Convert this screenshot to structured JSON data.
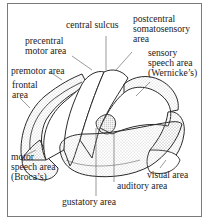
{
  "diagram": {
    "labels": {
      "central_sulcus": "central sulcus",
      "postcentral": [
        "postcentral",
        "somatosensory",
        "area"
      ],
      "precentral": [
        "precentral",
        "motor area"
      ],
      "sensory_speech": [
        "sensory",
        "speech area",
        "(Wernicke’s)"
      ],
      "premotor": "premotor area",
      "frontal": [
        "frontal",
        "area"
      ],
      "motor_speech": [
        "motor",
        "speech area",
        "(Broca’s)"
      ],
      "visual": "visual area",
      "auditory": "auditory area",
      "gustatory": "gustatory area"
    },
    "colors": {
      "frame": "#7a7a7a",
      "outline": "#2a2a2a",
      "stipple": "#9a9a9a",
      "text": "#222222"
    }
  }
}
